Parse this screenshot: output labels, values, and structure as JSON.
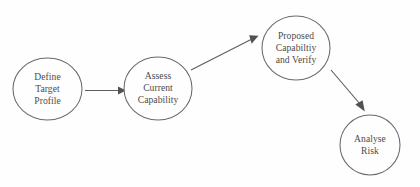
{
  "diagram": {
    "type": "flowchart",
    "background_color": "#ffffff",
    "node_stroke_color": "#4a4a4a",
    "edge_color": "#3d3d3d",
    "text_color": "#1d1d1d",
    "nodes": [
      {
        "id": "define-target-profile",
        "shape": "ellipse",
        "cx": 47.5,
        "cy": 89,
        "rx": 34.5,
        "ry": 31,
        "lines": [
          "Define",
          "Target",
          "Profile"
        ],
        "line1": "Define",
        "line2": "Target",
        "line3": "Profile"
      },
      {
        "id": "assess-current-capability",
        "shape": "ellipse",
        "cx": 158,
        "cy": 88.5,
        "rx": 34,
        "ry": 31.5,
        "lines": [
          "Assess",
          "Current",
          "Capability"
        ],
        "line1": "Assess",
        "line2": "Current",
        "line3": "Capability"
      },
      {
        "id": "proposed-capability-and-verify",
        "shape": "ellipse",
        "cx": 296,
        "cy": 48,
        "rx": 34,
        "ry": 32,
        "lines": [
          "Proposed",
          "Capabiltiy",
          "and Verify"
        ],
        "line1": "Proposed",
        "line2": "Capabiltiy",
        "line3": "and Verify"
      },
      {
        "id": "analyse-risk",
        "shape": "ellipse",
        "cx": 370,
        "cy": 145,
        "rx": 30,
        "ry": 30,
        "lines": [
          "Analyse",
          "Risk"
        ],
        "line1": "Analyse",
        "line2": "Risk"
      }
    ],
    "edges": [
      {
        "id": "edge-define-to-assess",
        "from": "define-target-profile",
        "to": "assess-current-capability",
        "style": "straight-arrow",
        "x1": 85,
        "y1": 90.5,
        "x2": 120,
        "y2": 90.5
      },
      {
        "id": "edge-assess-to-proposed",
        "from": "assess-current-capability",
        "to": "proposed-capability-and-verify",
        "style": "straight-arrow",
        "x1": 191,
        "y1": 70,
        "x2": 256,
        "y2": 38
      },
      {
        "id": "edge-proposed-to-analyse",
        "from": "proposed-capability-and-verify",
        "to": "analyse-risk",
        "style": "straight-arrow",
        "x1": 331,
        "y1": 70,
        "x2": 363,
        "y2": 108
      }
    ]
  }
}
